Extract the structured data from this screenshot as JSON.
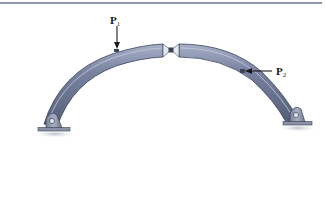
{
  "figure": {
    "type": "three-hinged arch diagram",
    "top_rule_color": "#8e97a8",
    "arch_color": "#6b7590",
    "arch_highlight": "#9ea8c0",
    "arch_edge": "#3c4458"
  },
  "loads": [
    {
      "id": "P1",
      "symbol": "P",
      "subscript": "1",
      "direction": "down",
      "location": "left arch segment, upper"
    },
    {
      "id": "P2",
      "symbol": "P",
      "subscript": "2",
      "direction": "left",
      "location": "right arch segment, mid"
    }
  ],
  "supports": [
    {
      "id": "A",
      "type": "pin",
      "side": "left"
    },
    {
      "id": "B",
      "type": "pin",
      "side": "right"
    }
  ],
  "hinges": [
    {
      "id": "C",
      "type": "pin",
      "location": "crown"
    }
  ]
}
